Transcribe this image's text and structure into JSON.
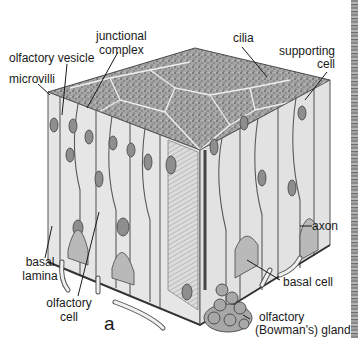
{
  "figure": {
    "panel_letter": "a",
    "colors": {
      "top_surface": "#9a9a9a",
      "cell_body": "#e4e4e4",
      "cell_border": "#5a5a5a",
      "nucleus": "#8c8c8c",
      "basal_cell": "#b9b9b9",
      "gland": "#a8a8a8",
      "text": "#1a1a1a",
      "background": "#ffffff"
    }
  },
  "labels": {
    "junctional_complex": "junctional\ncomplex",
    "junctional_line1": "junctional",
    "junctional_line2": "complex",
    "cilia": "cilia",
    "olfactory_vesicle": "olfactory vesicle",
    "microvilli": "microvilli",
    "supporting_line1": "supporting",
    "supporting_line2": "cell",
    "axon": "axon",
    "basal_lamina_line1": "basal",
    "basal_lamina_line2": "lamina",
    "basal_cell": "basal cell",
    "olfactory_cell_line1": "olfactory",
    "olfactory_cell_line2": "cell",
    "gland_line1": "olfactory",
    "gland_line2": "(Bowman's) gland"
  }
}
